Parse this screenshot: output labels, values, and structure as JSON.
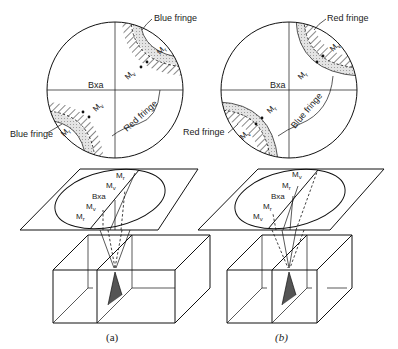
{
  "figure": {
    "panels": [
      {
        "id": "a",
        "caption": "(a)",
        "interference_figure": {
          "center_label": "Bxa",
          "fringe_labels": {
            "top_right": "Blue fringe",
            "bottom_left": "Blue fringe",
            "center_right": "Red fringe"
          },
          "melatope_labels": {
            "top_right_outer": "Mr",
            "top_right_inner": "Mv",
            "bottom_left_outer": "Mv",
            "bottom_left_inner": "Mr"
          }
        },
        "plane_labels": [
          "Mr",
          "Mv",
          "Bxa",
          "Mv",
          "Mr"
        ]
      },
      {
        "id": "b",
        "caption": "(b)",
        "interference_figure": {
          "center_label": "Bxa",
          "fringe_labels": {
            "top_right": "Red fringe",
            "bottom_left": "Red fringe",
            "center_right": "Blue fringe"
          },
          "melatope_labels": {
            "top_right_outer": "Mv",
            "top_right_inner": "Mr",
            "bottom_left_outer": "Mr",
            "bottom_left_inner": "Mv"
          }
        },
        "plane_labels": [
          "Mv",
          "Mr",
          "Bxa",
          "Mr",
          "Mv"
        ]
      }
    ],
    "colors": {
      "line": "#111111",
      "stipple": "#d9d9d9",
      "background": "#ffffff"
    }
  }
}
